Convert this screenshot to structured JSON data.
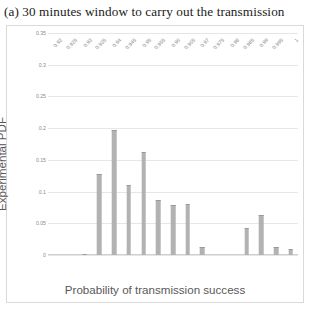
{
  "figure": {
    "caption": "(a) 30 minutes window to carry out the transmission"
  },
  "chart_data": {
    "type": "bar",
    "title": "(a) 30 minutes window to carry out the transmission",
    "xlabel": "Probability of transmission success",
    "ylabel": "Experimental PDF",
    "categories": [
      "0.92",
      "0.925",
      "0.93",
      "0.935",
      "0.94",
      "0.945",
      "0.95",
      "0.955",
      "0.96",
      "0.965",
      "0.97",
      "0.975",
      "0.98",
      "0.985",
      "0.99",
      "0.995",
      "1"
    ],
    "values": [
      0,
      0,
      0.002,
      0.128,
      0.197,
      0.11,
      0.163,
      0.087,
      0.079,
      0.081,
      0.013,
      0,
      0,
      0.042,
      0.063,
      0.012,
      0.01
    ],
    "yticks": [
      "0",
      "0.05",
      "0.1",
      "0.15",
      "0.2",
      "0.25",
      "0.3",
      "0.35"
    ],
    "ytickvalues": [
      0,
      0.05,
      0.1,
      0.15,
      0.2,
      0.25,
      0.3,
      0.35
    ],
    "ylim": [
      0,
      0.35
    ],
    "grid": "horizontal",
    "legend": "none",
    "bar_color": "#b2b2b2",
    "grid_color": "#e6e6e6"
  }
}
